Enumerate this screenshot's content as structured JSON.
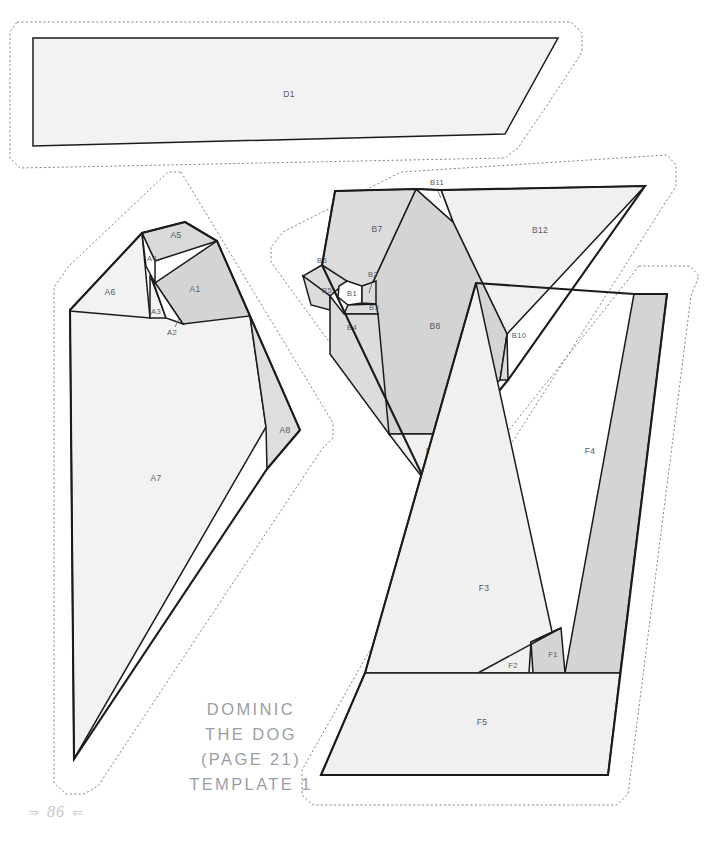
{
  "document": {
    "kind": "paper-piecing-template-sheet",
    "page_number": "86",
    "folio_ornament_left": "⇒",
    "folio_ornament_right": "⇐"
  },
  "title_block": {
    "line1": "DOMINIC",
    "line2": "THE DOG",
    "line3": "(PAGE 21)",
    "line4": "TEMPLATE 1"
  },
  "colors": {
    "page_background": "#ffffff",
    "ink": "#1b1b1b",
    "cut_line": "#8a8a8a",
    "label_text": "#555b63",
    "title_text": "#9a9ea4",
    "folio_text": "#c3c6ca",
    "fill_light": "#f2f2f2",
    "fill_medium": "#e2e2e2",
    "fill_dark": "#d5d5d5",
    "fill_white": "#ffffff"
  },
  "sections": [
    {
      "id": "D",
      "name": "section-d",
      "pieces": [
        {
          "label": "D1",
          "shade": "light"
        }
      ]
    },
    {
      "id": "A",
      "name": "section-a",
      "pieces": [
        {
          "label": "A1",
          "shade": "dark"
        },
        {
          "label": "A2",
          "shade": "white"
        },
        {
          "label": "A3",
          "shade": "light"
        },
        {
          "label": "A4",
          "shade": "white"
        },
        {
          "label": "A5",
          "shade": "medium"
        },
        {
          "label": "A6",
          "shade": "light"
        },
        {
          "label": "A7",
          "shade": "light"
        },
        {
          "label": "A8",
          "shade": "medium"
        }
      ]
    },
    {
      "id": "B",
      "name": "section-b",
      "pieces": [
        {
          "label": "B1",
          "shade": "white"
        },
        {
          "label": "B2",
          "shade": "medium"
        },
        {
          "label": "B3",
          "shade": "medium"
        },
        {
          "label": "B4",
          "shade": "medium"
        },
        {
          "label": "B5",
          "shade": "medium"
        },
        {
          "label": "B6",
          "shade": "medium"
        },
        {
          "label": "B7",
          "shade": "medium"
        },
        {
          "label": "B8",
          "shade": "dark"
        },
        {
          "label": "B9",
          "shade": "light"
        },
        {
          "label": "B10",
          "shade": "medium"
        },
        {
          "label": "B11",
          "shade": "white"
        },
        {
          "label": "B12",
          "shade": "light"
        }
      ]
    },
    {
      "id": "F",
      "name": "section-f",
      "pieces": [
        {
          "label": "F1",
          "shade": "dark"
        },
        {
          "label": "F2",
          "shade": "light"
        },
        {
          "label": "F3",
          "shade": "light"
        },
        {
          "label": "F4",
          "shade": "dark"
        },
        {
          "label": "F5",
          "shade": "light"
        }
      ]
    }
  ],
  "labels": {
    "D1": "D1",
    "A1": "A1",
    "A2": "A2",
    "A3": "A3",
    "A4": "A4",
    "A5": "A5",
    "A6": "A6",
    "A7": "A7",
    "A8": "A8",
    "B1": "B1",
    "B2": "B2",
    "B3": "B3",
    "B4": "B4",
    "B5": "B5",
    "B6": "B6",
    "B7": "B7",
    "B8": "B8",
    "B9": "B9",
    "B10": "B10",
    "B11": "B11",
    "B12": "B12",
    "F1": "F1",
    "F2": "F2",
    "F3": "F3",
    "F4": "F4",
    "F5": "F5"
  }
}
